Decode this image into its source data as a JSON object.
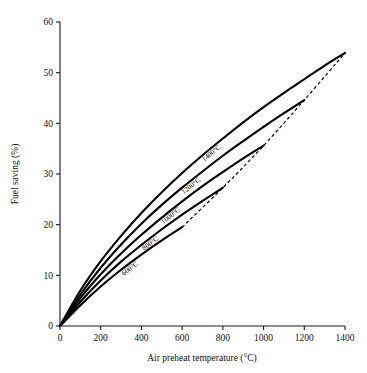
{
  "chart_data": {
    "type": "line",
    "title": "",
    "xlabel": "Air preheat temperature (°C)",
    "ylabel": "Fuel saving (%)",
    "xlim": [
      0,
      1400
    ],
    "ylim": [
      0,
      60
    ],
    "xticks": [
      0,
      200,
      400,
      600,
      800,
      1000,
      1200,
      1400
    ],
    "yticks": [
      0,
      10,
      20,
      30,
      40,
      50,
      60
    ],
    "grid": false,
    "legend_position": "inline-curve-labels",
    "annotations": [
      "Each solid curve is labelled with its flue gas temperature and ends at the maximum attainable air preheat temperature",
      "The dashed curve is the envelope joining the end points of the solid curves"
    ],
    "series": [
      {
        "name": "1400°C",
        "label": "1400°C",
        "style": "solid",
        "points": [
          [
            0,
            0
          ],
          [
            100,
            7.0
          ],
          [
            200,
            12.8
          ],
          [
            300,
            17.8
          ],
          [
            400,
            22.3
          ],
          [
            500,
            26.4
          ],
          [
            600,
            30.2
          ],
          [
            700,
            33.7
          ],
          [
            800,
            37.0
          ],
          [
            900,
            40.2
          ],
          [
            1000,
            43.2
          ],
          [
            1100,
            46.0
          ],
          [
            1200,
            48.7
          ],
          [
            1300,
            51.4
          ],
          [
            1400,
            53.9
          ]
        ]
      },
      {
        "name": "1200°C",
        "label": "1200°C",
        "style": "solid",
        "points": [
          [
            0,
            0
          ],
          [
            100,
            6.2
          ],
          [
            200,
            11.5
          ],
          [
            300,
            16.1
          ],
          [
            400,
            20.2
          ],
          [
            500,
            23.9
          ],
          [
            600,
            27.3
          ],
          [
            700,
            30.5
          ],
          [
            800,
            33.6
          ],
          [
            900,
            36.5
          ],
          [
            1000,
            39.3
          ],
          [
            1100,
            42.0
          ],
          [
            1200,
            44.6
          ]
        ]
      },
      {
        "name": "1000°C",
        "label": "1000°C",
        "style": "solid",
        "points": [
          [
            0,
            0
          ],
          [
            100,
            5.5
          ],
          [
            200,
            10.2
          ],
          [
            300,
            14.3
          ],
          [
            400,
            18.0
          ],
          [
            500,
            21.4
          ],
          [
            600,
            24.6
          ],
          [
            700,
            27.6
          ],
          [
            800,
            30.4
          ],
          [
            900,
            33.1
          ],
          [
            1000,
            35.6
          ]
        ]
      },
      {
        "name": "800°C",
        "label": "800°C",
        "style": "solid",
        "points": [
          [
            0,
            0
          ],
          [
            100,
            4.8
          ],
          [
            200,
            9.0
          ],
          [
            300,
            12.7
          ],
          [
            400,
            16.0
          ],
          [
            500,
            19.1
          ],
          [
            600,
            22.0
          ],
          [
            700,
            24.7
          ],
          [
            800,
            27.3
          ]
        ]
      },
      {
        "name": "600°C",
        "label": "600°C",
        "style": "solid",
        "points": [
          [
            0,
            0
          ],
          [
            100,
            4.1
          ],
          [
            200,
            7.8
          ],
          [
            300,
            11.1
          ],
          [
            400,
            14.1
          ],
          [
            500,
            16.9
          ],
          [
            600,
            19.5
          ]
        ]
      },
      {
        "name": "envelope",
        "label": "",
        "style": "dashed",
        "points": [
          [
            600,
            19.5
          ],
          [
            800,
            27.3
          ],
          [
            1000,
            35.6
          ],
          [
            1200,
            44.6
          ],
          [
            1400,
            53.9
          ]
        ]
      }
    ]
  }
}
